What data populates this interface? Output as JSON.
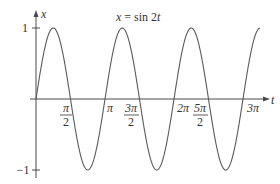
{
  "chart_data": {
    "type": "line",
    "title": "x = sin 2t",
    "title_parts": {
      "lhs": "x",
      "eq": " = sin 2",
      "var": "t"
    },
    "xlabel": "t",
    "ylabel": "x",
    "function": "x = sin(2t)",
    "xlim": [
      0,
      3.1416
    ],
    "ylim": [
      -1,
      1
    ],
    "x_domain_plotted": [
      0,
      10.2
    ],
    "grid": false,
    "legend": null,
    "x_ticks": [
      {
        "value": 1.5708,
        "label": "π/2",
        "num": "π",
        "den": "2"
      },
      {
        "value": 3.1416,
        "label": "π"
      },
      {
        "value": 4.7124,
        "label": "3π/2",
        "num": "3π",
        "den": "2"
      },
      {
        "value": 6.2832,
        "label": "2π"
      },
      {
        "value": 7.854,
        "label": "5π/2",
        "num": "5π",
        "den": "2"
      },
      {
        "value": 9.4248,
        "label": "3π"
      }
    ],
    "y_ticks": [
      {
        "value": 1,
        "label": "1"
      },
      {
        "value": -1,
        "label": "−1"
      }
    ],
    "series": [
      {
        "name": "sin 2t",
        "x": [
          0,
          0.7854,
          1.5708,
          2.3562,
          3.1416,
          3.927,
          4.7124,
          5.4978,
          6.2832,
          7.0686,
          7.854,
          8.6394,
          9.4248,
          10.2
        ],
        "values": [
          0,
          1,
          0,
          -1,
          0,
          1,
          0,
          -1,
          0,
          1,
          0,
          -1,
          0,
          0.96
        ]
      }
    ],
    "colors": {
      "curve": "#5a5a5a",
      "axis": "#4a4a4a",
      "text": "#333333"
    }
  },
  "labels": {
    "title_lhs": "x",
    "title_rhs": " = sin 2",
    "title_var": "t",
    "x_axis": "t",
    "y_axis": "x",
    "y_tick_top": "1",
    "y_tick_bottom": "−1",
    "tick_pi_half_num": "π",
    "tick_pi_half_den": "2",
    "tick_pi": "π",
    "tick_3pi_half_num": "3π",
    "tick_3pi_half_den": "2",
    "tick_2pi": "2π",
    "tick_5pi_half_num": "5π",
    "tick_5pi_half_den": "2",
    "tick_3pi": "3π"
  }
}
